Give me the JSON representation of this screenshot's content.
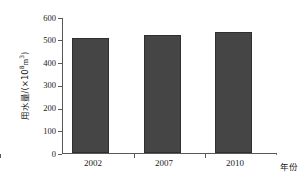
{
  "chart_data": {
    "type": "bar",
    "title": "",
    "categories": [
      "2002",
      "2007",
      "2010"
    ],
    "values": [
      510,
      525,
      540
    ],
    "series": [
      {
        "name": "用水量",
        "values": [
          510,
          525,
          540
        ]
      }
    ],
    "xlabel": "年份",
    "ylabel": "用水量/(×10⁸m³)",
    "ylabel_prefix": "用水量/(×10",
    "ylabel_exponent": "8",
    "ylabel_suffix": "m",
    "ylabel_suffix_exponent": "3",
    "ylabel_close": ")",
    "ylim": [
      0,
      600
    ],
    "ytick_labels": [
      "600",
      "500",
      "400",
      "300",
      "200",
      "100",
      "0"
    ],
    "ytick_values": [
      600,
      500,
      400,
      300,
      200,
      100,
      0
    ],
    "ytick_step": 100,
    "grid": true,
    "legend": "none",
    "bar_color": "#454545",
    "bar_edge_color": "#2f2f2f",
    "grid_color": "#6e6e6e",
    "axis_color": "#585858",
    "background": "#ffffff"
  }
}
